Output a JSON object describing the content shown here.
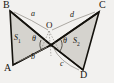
{
  "figure": {
    "kind": "bowtie-two-triangles-geometry-diagram",
    "background_color": "#f2f1ef",
    "fill_color": "#d4d2cd",
    "stroke_color": "#14120d",
    "arc_color": "#8c8881",
    "vertices": [
      {
        "id": "B",
        "label": "B",
        "x": 9,
        "y": 8
      },
      {
        "id": "A",
        "label": "A",
        "x": 11,
        "y": 68
      },
      {
        "id": "C",
        "label": "C",
        "x": 100,
        "y": 8
      },
      {
        "id": "D",
        "label": "D",
        "x": 84,
        "y": 74
      },
      {
        "id": "O",
        "label": "O",
        "x": 49,
        "y": 26
      }
    ],
    "apex": {
      "id": "P",
      "x": 51,
      "y": 45
    },
    "arcs": [
      {
        "id": "a",
        "label": "a",
        "between": "B-O",
        "x": 33,
        "y": 14
      },
      {
        "id": "b",
        "label": "b",
        "between": "A-O",
        "x": 33,
        "y": 57
      },
      {
        "id": "c",
        "label": "c",
        "between": "O-D",
        "x": 62,
        "y": 64
      },
      {
        "id": "d",
        "label": "d",
        "between": "O-C",
        "x": 72,
        "y": 15
      }
    ],
    "regions": [
      {
        "id": "S1",
        "base": "S",
        "sub": "1",
        "x": 17,
        "y": 38
      },
      {
        "id": "S2",
        "base": "S",
        "sub": "2",
        "x": 76,
        "y": 41
      }
    ],
    "angles": [
      {
        "id": "theta-left",
        "label": "θ",
        "at": "O",
        "x": 34,
        "y": 38
      },
      {
        "id": "theta-right",
        "label": "θ",
        "at": "O",
        "x": 65,
        "y": 41
      }
    ]
  }
}
